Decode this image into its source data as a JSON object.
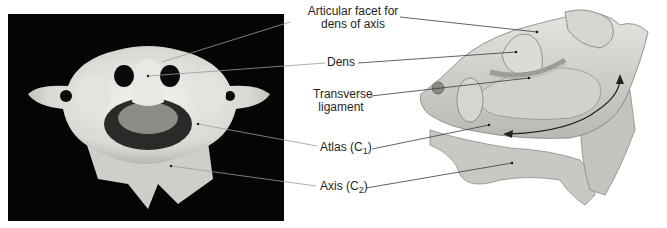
{
  "figure": {
    "left_panel": {
      "type": "photograph",
      "subject": "atlas-and-axis-superior-view",
      "background": "#050505"
    },
    "right_panel": {
      "type": "illustration",
      "subject": "atlanto-axial-joint-posterosuperior-view"
    }
  },
  "labels": {
    "articular_facet": {
      "line1": "Articular facet for",
      "line2": "dens of axis"
    },
    "dens": "Dens",
    "transverse_ligament": {
      "line1": "Transverse",
      "line2": "ligament"
    },
    "atlas": {
      "text": "Atlas (C",
      "sub": "1",
      "close": ")"
    },
    "axis": {
      "text": "Axis (C",
      "sub": "2",
      "close": ")"
    }
  },
  "arrow": {
    "meaning": "rotation-of-atlas-around-dens",
    "color": "#222222"
  }
}
